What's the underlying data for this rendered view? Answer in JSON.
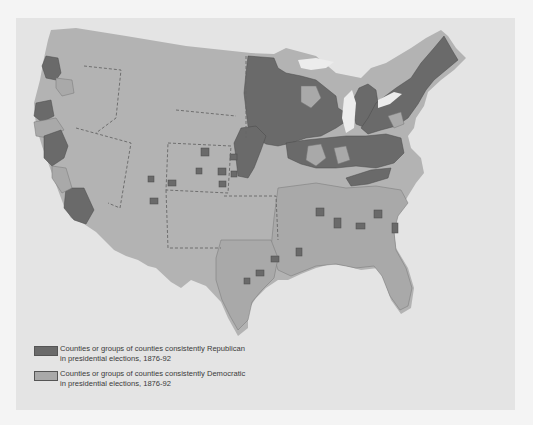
{
  "map": {
    "subject": "United States counties by consistent presidential voting, 1876-92",
    "colors": {
      "background": "#e4e4e4",
      "land_democratic": "#a9a9a9",
      "land_republican": "#6a6a6a",
      "land_base": "#b3b3b3",
      "water": "#ececec",
      "state_border_dashed": "#666666"
    }
  },
  "legend": {
    "items": [
      {
        "label_line1": "Counties or groups of counties consistently Republican",
        "label_line2": "in presidential elections, 1876-92",
        "color": "#6a6a6a"
      },
      {
        "label_line1": "Counties or groups of counties consistently Democratic",
        "label_line2": "in presidential elections, 1876-92",
        "color": "#a9a9a9"
      }
    ]
  }
}
